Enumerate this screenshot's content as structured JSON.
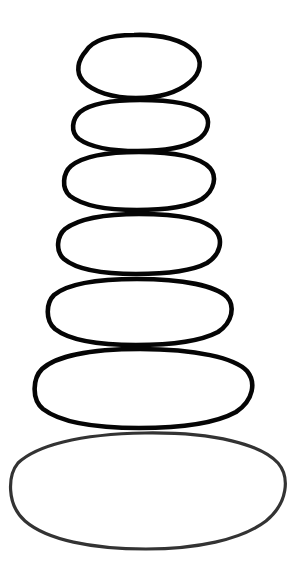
{
  "artwork": {
    "title": "Stacked Stones",
    "subject": "cairn",
    "description": "Hand-drawn stack of seven rounded stones, narrowest at top and widest at bottom",
    "background_color": "#ffffff",
    "canvas": {
      "width": 297,
      "height": 576
    },
    "style": {
      "fill": "#ffffff",
      "stroke_color_primary": "#050505",
      "stroke_color_base": "#333333",
      "stroke_width_primary": 4.6,
      "stroke_width_base": 3.2,
      "line_quality": "hand-drawn wobbly outline"
    },
    "stone_count": 7
  },
  "stones": [
    {
      "index": 1,
      "name": "stone-top",
      "position": "top",
      "cx": 139,
      "cy": 66,
      "rx": 61,
      "ry": 30,
      "stroke": "#050505",
      "stroke_width": 4.6,
      "path": "M 86 51 C 93 40 110 35 134 35 C 161 34 183 40 194 51 C 203 60 201 73 190 82 C 177 93 157 98 136 98 C 113 98 93 92 83 81 C 75 72 78 60 86 51 Z"
    },
    {
      "index": 2,
      "name": "stone-second",
      "position": "second",
      "cx": 139,
      "cy": 124,
      "rx": 67,
      "ry": 25,
      "stroke": "#050505",
      "stroke_width": 4.6,
      "path": "M 80 112 C 90 104 110 100 140 100 C 172 100 195 104 204 113 C 211 120 209 133 197 140 C 184 148 162 151 138 151 C 112 151 90 147 79 139 C 70 132 72 119 80 112 Z"
    },
    {
      "index": 3,
      "name": "stone-third",
      "position": "third",
      "cx": 138,
      "cy": 180,
      "rx": 75,
      "ry": 28,
      "stroke": "#050505",
      "stroke_width": 4.6,
      "path": "M 71 166 C 82 157 105 152 139 152 C 177 152 201 158 210 168 C 217 176 215 190 202 199 C 188 207 164 210 137 210 C 106 210 82 205 70 196 C 61 188 63 173 71 166 Z"
    },
    {
      "index": 4,
      "name": "stone-fourth",
      "position": "fourth",
      "cx": 138,
      "cy": 243,
      "rx": 80,
      "ry": 29,
      "stroke": "#050505",
      "stroke_width": 4.6,
      "path": "M 65 229 C 77 220 101 214 139 214 C 180 214 207 220 216 231 C 223 240 221 254 207 263 C 192 271 166 274 136 274 C 102 274 76 269 64 259 C 55 251 57 236 65 229 Z"
    },
    {
      "index": 5,
      "name": "stone-fifth",
      "position": "fifth",
      "cx": 139,
      "cy": 310,
      "rx": 92,
      "ry": 32,
      "stroke": "#050505",
      "stroke_width": 4.6,
      "path": "M 54 295 C 66 285 93 279 137 279 C 184 279 216 286 227 297 C 235 306 233 322 218 332 C 201 341 171 345 136 345 C 99 345 69 340 55 329 C 45 320 46 303 54 295 Z"
    },
    {
      "index": 6,
      "name": "stone-sixth",
      "position": "sixth",
      "cx": 143,
      "cy": 387,
      "rx": 108,
      "ry": 38,
      "stroke": "#050505",
      "stroke_width": 4.6,
      "path": "M 42 369 C 55 357 87 349 140 349 C 196 349 235 358 247 371 C 256 382 254 400 236 412 C 216 423 180 428 139 428 C 95 428 60 422 43 409 C 31 399 33 378 42 369 Z"
    },
    {
      "index": 7,
      "name": "stone-base",
      "position": "base",
      "cx": 148,
      "cy": 490,
      "rx": 136,
      "ry": 58,
      "stroke": "#333333",
      "stroke_width": 3.2,
      "path": "M 18 463 C 36 446 78 434 145 433 C 215 432 262 445 278 463 C 290 477 288 503 266 521 C 241 540 196 549 146 549 C 92 549 47 540 25 521 C 6 504 8 475 18 463 Z"
    }
  ]
}
